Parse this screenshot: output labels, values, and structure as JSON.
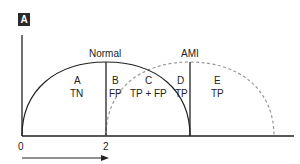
{
  "panel": {
    "label": "A"
  },
  "curves": {
    "normal": {
      "label": "Normal",
      "style": "solid",
      "color": "#222222"
    },
    "ami": {
      "label": "AMI",
      "style": "dashed",
      "color": "#999999"
    }
  },
  "regions": [
    {
      "id": "A",
      "letter": "A",
      "class": "TN"
    },
    {
      "id": "B",
      "letter": "B",
      "class": "FP"
    },
    {
      "id": "C",
      "letter": "C",
      "class": "TP + FP"
    },
    {
      "id": "D",
      "letter": "D",
      "class": "TP"
    },
    {
      "id": "E",
      "letter": "E",
      "class": "TP"
    }
  ],
  "axis": {
    "ticks": [
      "0",
      "2"
    ]
  }
}
